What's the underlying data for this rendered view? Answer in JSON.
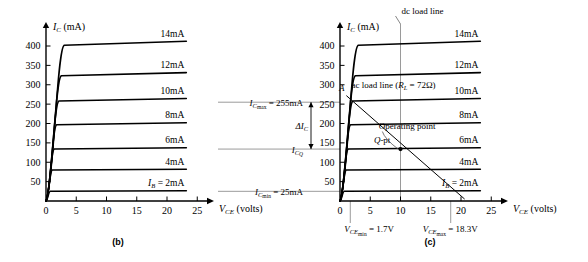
{
  "figure": {
    "background_color": "#ffffff",
    "stroke_color": "#000000",
    "grid_color": "#8a8a8a"
  },
  "panels": [
    {
      "id": "b",
      "caption": "(b)",
      "axes": {
        "y_axis_label_main": "I",
        "y_axis_label_sub": "C",
        "y_axis_label_unit": "(mA)",
        "x_axis_label_main": "V",
        "x_axis_label_sub": "CE",
        "x_axis_label_unit": "(volts)",
        "y_ticks": [
          50,
          100,
          150,
          200,
          250,
          300,
          350,
          400
        ],
        "x_ticks": [
          0,
          5,
          10,
          15,
          20,
          25
        ],
        "y_min": 0,
        "y_max": 430,
        "x_min": 0,
        "x_max": 26.5
      },
      "curves": [
        {
          "label": "14mA",
          "ib_mA": 14,
          "ic_sat_mA": 402
        },
        {
          "label": "12mA",
          "ib_mA": 12,
          "ic_sat_mA": 323
        },
        {
          "label": "10mA",
          "ib_mA": 10,
          "ic_sat_mA": 258
        },
        {
          "label": "8mA",
          "ib_mA": 8,
          "ic_sat_mA": 197
        },
        {
          "label": "6mA",
          "ib_mA": 6,
          "ic_sat_mA": 134
        },
        {
          "label": "4mA",
          "ib_mA": 4,
          "ic_sat_mA": 80
        },
        {
          "label": "2mA",
          "ib_mA": 2,
          "ic_sat_mA": 25,
          "label_prefix_main": "I",
          "label_prefix_sub": "B",
          "label_prefix_eq": "="
        }
      ]
    },
    {
      "id": "c",
      "caption": "(c)",
      "axes": {
        "y_axis_label_main": "I",
        "y_axis_label_sub": "C",
        "y_axis_label_unit": "(mA)",
        "x_axis_label_main": "V",
        "x_axis_label_sub": "CE",
        "x_axis_label_unit": "(volts)",
        "y_ticks": [
          50,
          100,
          150,
          200,
          250,
          300,
          350,
          400
        ],
        "x_ticks": [
          0,
          5,
          10,
          15,
          20,
          25
        ],
        "y_min": 0,
        "y_max": 430,
        "x_min": 0,
        "x_max": 26.5
      },
      "curves": [
        {
          "label": "14mA",
          "ib_mA": 14,
          "ic_sat_mA": 402
        },
        {
          "label": "12mA",
          "ib_mA": 12,
          "ic_sat_mA": 323
        },
        {
          "label": "10mA",
          "ib_mA": 10,
          "ic_sat_mA": 258
        },
        {
          "label": "8mA",
          "ib_mA": 8,
          "ic_sat_mA": 197
        },
        {
          "label": "6mA",
          "ib_mA": 6,
          "ic_sat_mA": 134
        },
        {
          "label": "4mA",
          "ib_mA": 4,
          "ic_sat_mA": 80
        },
        {
          "label": "2mA",
          "ib_mA": 2,
          "ic_sat_mA": 25,
          "label_prefix_main": "I",
          "label_prefix_sub": "B",
          "label_prefix_eq": "="
        }
      ],
      "annotations": {
        "dc_load_line_label": "dc load line",
        "dc_load_line_v": 10,
        "ac_load_line_label_pre": "ac load line  (",
        "ac_load_line_label_r_main": "R",
        "ac_load_line_label_r_sub": "L",
        "ac_load_line_label_post": "=  72Ω)",
        "point_a_label": "A",
        "operating_point_label": "Operating point",
        "q_point_label_main": "Q",
        "q_point_label_rest": "-pt",
        "q_point_v": 10,
        "q_point_i": 134,
        "ic_max_label_main": "I",
        "ic_max_label_sub": "C",
        "ic_max_label_subsub": "max",
        "ic_max_label_value": "=  255mA",
        "ic_max_mA": 255,
        "ic_q_label_main": "I",
        "ic_q_label_sub": "C",
        "ic_q_label_subsub": "Q",
        "ic_q_mA": 134,
        "ic_min_label_main": "I",
        "ic_min_label_sub": "C",
        "ic_min_label_subsub": "min",
        "ic_min_label_value": "=  25mA",
        "ic_min_mA": 25,
        "delta_ic_label_main": "ΔI",
        "delta_ic_label_sub": "C",
        "vce_min_label_main": "V",
        "vce_min_label_sub": "CE",
        "vce_min_label_subsub": "min",
        "vce_min_label_value": "=  1.7V",
        "vce_min_V": 1.7,
        "vce_max_label_main": "V",
        "vce_max_label_sub": "CE",
        "vce_max_label_subsub": "max",
        "vce_max_label_value": "=  18.3V",
        "vce_max_V": 18.3
      }
    }
  ]
}
